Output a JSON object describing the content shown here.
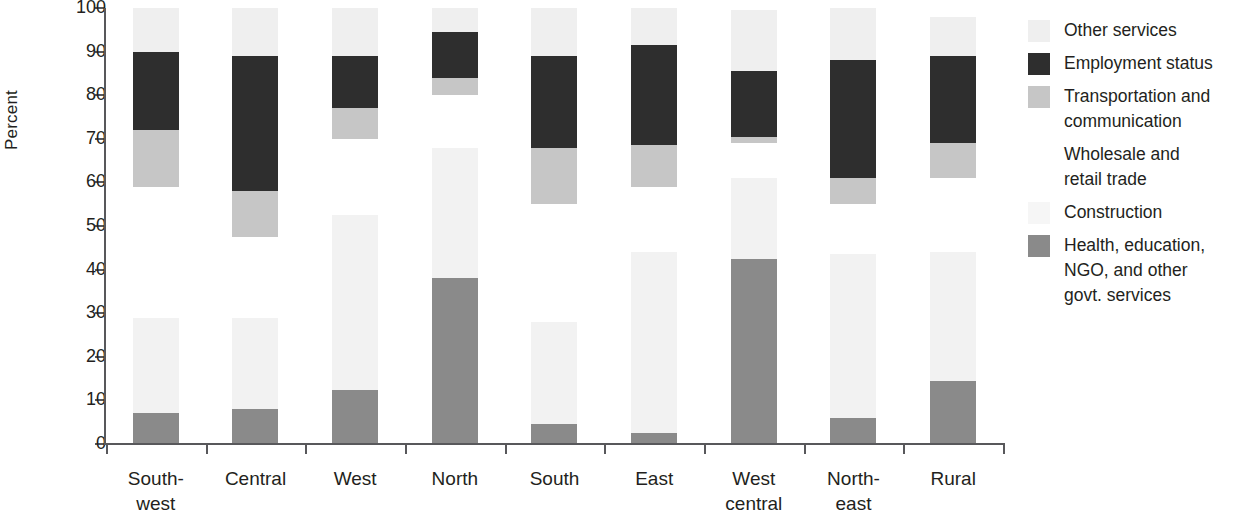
{
  "chart_data": {
    "type": "bar",
    "stacked": true,
    "title": "",
    "xlabel": "",
    "ylabel": "Percent",
    "ylim": [
      0,
      100
    ],
    "ytick_labels": [
      "0",
      "10",
      "20",
      "30",
      "40",
      "50",
      "60",
      "70",
      "80",
      "90",
      "100"
    ],
    "yticks": [
      0,
      10,
      20,
      30,
      40,
      50,
      60,
      70,
      80,
      90,
      100
    ],
    "grid": false,
    "legend_position": "right",
    "categories": [
      "South-west",
      "Central",
      "West",
      "North",
      "South",
      "East",
      "West central",
      "North-east",
      "Rural"
    ],
    "category_lines": [
      [
        "South-",
        "west"
      ],
      [
        "Central"
      ],
      [
        "West"
      ],
      [
        "North"
      ],
      [
        "South"
      ],
      [
        "East"
      ],
      [
        "West",
        "central"
      ],
      [
        "North-",
        "east"
      ],
      [
        "Rural"
      ]
    ],
    "series": [
      {
        "name": "Health, education, NGO, and other govt. services",
        "color": "#8a8a8a",
        "values": [
          7,
          8,
          12.5,
          38,
          4.5,
          2.5,
          42.5,
          6,
          14.5
        ]
      },
      {
        "name": "Construction",
        "color": "#f6f6f6",
        "values": [
          22,
          21,
          40,
          30,
          23.5,
          41.5,
          18.5,
          37.5,
          29.5
        ]
      },
      {
        "name": "Wholesale and retail trade",
        "color": "#ffffff",
        "values": [
          30,
          18.5,
          17.5,
          12,
          27,
          15,
          8,
          11.5,
          17
        ]
      },
      {
        "name": "Transportation and communication",
        "color": "#c6c6c6",
        "values": [
          13,
          10.5,
          7,
          4,
          13,
          9.5,
          1.5,
          6,
          8
        ]
      },
      {
        "name": "Employment status",
        "color": "#2e2e2e",
        "values": [
          18,
          31,
          12,
          10.5,
          21,
          23,
          15,
          27,
          20
        ]
      },
      {
        "name": "Other services",
        "color": "#efefef",
        "values": [
          10,
          11,
          11,
          5.5,
          11,
          8.5,
          14,
          12,
          9
        ]
      }
    ],
    "segment_tops": {
      "South-west": {
        "health": 7,
        "construction": 29,
        "wholesale": 59,
        "transport": 72,
        "employment": 90,
        "other": 100
      },
      "Central": {
        "health": 8,
        "construction": 29,
        "wholesale": 47.5,
        "transport": 58,
        "employment": 89,
        "other": 100
      },
      "West": {
        "health": 12.5,
        "construction": 52.5,
        "wholesale": 70,
        "transport": 77,
        "employment": 89,
        "other": 100
      },
      "North": {
        "health": 38,
        "construction": 68,
        "wholesale": 80,
        "transport": 84,
        "employment": 94.5,
        "other": 100
      },
      "South": {
        "health": 4.5,
        "construction": 28,
        "wholesale": 55,
        "transport": 68,
        "employment": 89,
        "other": 100
      },
      "East": {
        "health": 2.5,
        "construction": 44,
        "wholesale": 59,
        "transport": 68.5,
        "employment": 91.5,
        "other": 100
      },
      "West central": {
        "health": 42.5,
        "construction": 61,
        "wholesale": 69,
        "transport": 70.5,
        "employment": 86,
        "other": 100
      },
      "North-east": {
        "health": 6,
        "construction": 43.5,
        "wholesale": 55,
        "transport": 61,
        "employment": 88,
        "other": 100
      },
      "Rural": {
        "health": 14.5,
        "construction": 44,
        "wholesale": 61,
        "transport": 69,
        "employment": 89,
        "other": 98
      }
    }
  },
  "legend": {
    "items": [
      {
        "label": "Other services",
        "swatch_class": "sw-other",
        "name": "legend-swatch-other-services"
      },
      {
        "label": "Employment status",
        "swatch_class": "sw-employment",
        "name": "legend-swatch-employment-status"
      },
      {
        "label": "Transportation and\ncommunication",
        "swatch_class": "sw-transport",
        "name": "legend-swatch-transportation"
      },
      {
        "label": "Wholesale and\nretail trade",
        "swatch_class": "sw-wholesale",
        "name": "legend-swatch-wholesale"
      },
      {
        "label": "Construction",
        "swatch_class": "sw-construction",
        "name": "legend-swatch-construction"
      },
      {
        "label": "Health, education,\nNGO, and other\ngovt. services",
        "swatch_class": "sw-health",
        "name": "legend-swatch-health"
      }
    ]
  }
}
